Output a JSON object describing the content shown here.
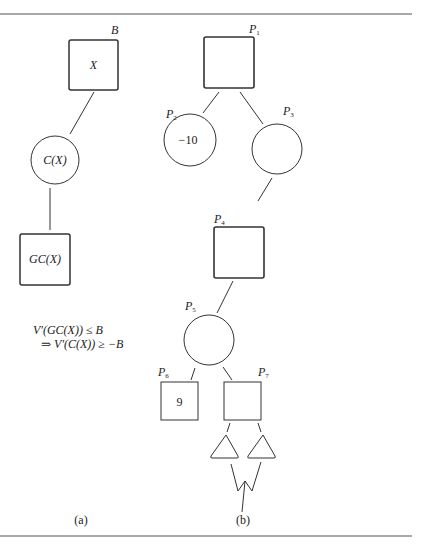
{
  "figure": {
    "panel_a": {
      "caption": "(a)",
      "nodes": {
        "max_node": {
          "label": "B",
          "content": "X",
          "shape": "square"
        },
        "min_node": {
          "content": "C(X)",
          "shape": "circle"
        },
        "grandchild_node": {
          "content": "GC(X)",
          "shape": "square"
        }
      },
      "equation": {
        "line1": "V′(GC(X)) ≤ B",
        "line2": "⇒ V′(C(X)) ≥ −B"
      }
    },
    "panel_b": {
      "caption": "(b)",
      "nodes": [
        {
          "id": "P1",
          "label": "P",
          "sub": "1",
          "shape": "square",
          "value": ""
        },
        {
          "id": "P2",
          "label": "P",
          "sub": "2",
          "shape": "circle",
          "value": "−10"
        },
        {
          "id": "P3",
          "label": "P",
          "sub": "3",
          "shape": "circle",
          "value": ""
        },
        {
          "id": "P4",
          "label": "P",
          "sub": "4",
          "shape": "square",
          "value": ""
        },
        {
          "id": "P5",
          "label": "P",
          "sub": "5",
          "shape": "circle",
          "value": ""
        },
        {
          "id": "P6",
          "label": "P",
          "sub": "6",
          "shape": "square",
          "value": "9"
        },
        {
          "id": "P7",
          "label": "P",
          "sub": "7",
          "shape": "square",
          "value": ""
        }
      ],
      "subtrees": [
        "triangle-left",
        "triangle-right"
      ]
    }
  }
}
